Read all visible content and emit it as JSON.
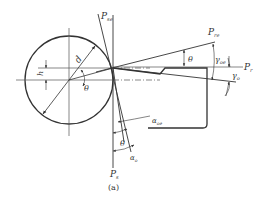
{
  "diagram": {
    "caption": "(a)",
    "colors": {
      "stroke": "#333333",
      "background": "#ffffff"
    },
    "labels": {
      "p_se": "P",
      "p_se_sub": "se",
      "p_re": "P",
      "p_re_sub": "re",
      "p_r": "P",
      "p_r_sub": "r",
      "p_s": "P",
      "p_s_sub": "s",
      "d": "d",
      "h": "h",
      "theta_center": "θ",
      "theta_re": "θ",
      "theta_s": "θ",
      "gamma_oe": "γ",
      "gamma_oe_sub": "oe",
      "gamma_o": "γ",
      "gamma_o_sub": "o",
      "alpha_oe": "α",
      "alpha_oe_sub": "oe",
      "alpha_o": "α",
      "alpha_o_sub": "o"
    }
  }
}
